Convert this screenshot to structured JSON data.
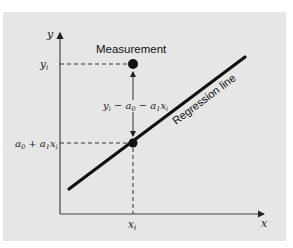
{
  "diagram": {
    "axes": {
      "x_label": "x",
      "y_label": "y"
    },
    "labels": {
      "measurement": "Measurement",
      "regression_line": "Regression line",
      "yi": "y",
      "yi_sub": "i",
      "xi": "x",
      "xi_sub": "i",
      "fitted": "a0 + a1xi",
      "residual": "yi − a0 − a1xi"
    },
    "colors": {
      "panel": "#e6e6e6",
      "line": "#111111",
      "axis": "#444444",
      "text": "#222222"
    }
  }
}
